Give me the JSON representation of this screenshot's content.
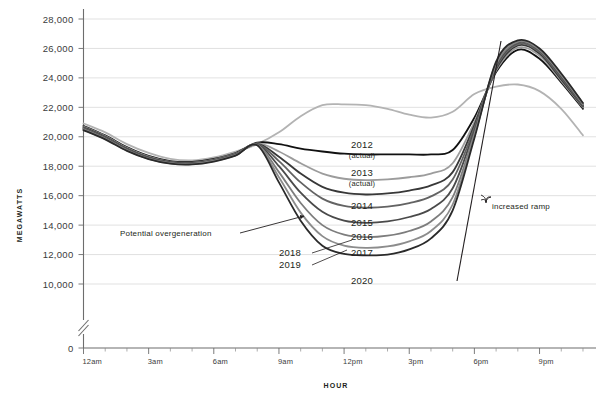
{
  "chart_data": {
    "type": "line",
    "title": "",
    "xlabel": "HOUR",
    "ylabel": "MEGAWATTS",
    "ylim": [
      0,
      28000
    ],
    "y_axis_break": true,
    "y_break_between": [
      0,
      10000
    ],
    "grid": true,
    "legend_position": "inline-labels",
    "yticks": [
      "0",
      "10,000",
      "12,000",
      "14,000",
      "16,000",
      "18,000",
      "20,000",
      "22,000",
      "24,000",
      "26,000",
      "28,000"
    ],
    "ytick_values": [
      0,
      10000,
      12000,
      14000,
      16000,
      18000,
      20000,
      22000,
      24000,
      26000,
      28000
    ],
    "xticks": [
      "12am",
      "3am",
      "6am",
      "9am",
      "12pm",
      "3pm",
      "6pm",
      "9pm"
    ],
    "xtick_values": [
      0,
      3,
      6,
      9,
      12,
      15,
      18,
      21
    ],
    "x": [
      0,
      1,
      2,
      3,
      4,
      5,
      6,
      7,
      8,
      9,
      10,
      11,
      12,
      13,
      14,
      15,
      16,
      17,
      18,
      19,
      20,
      21,
      22,
      23
    ],
    "series": [
      {
        "name": "2012",
        "sublabel": "(actual)",
        "color": "#b3b3b3",
        "width": 1.8,
        "values": [
          20900,
          20300,
          19500,
          18900,
          18500,
          18400,
          18600,
          19000,
          19500,
          20300,
          21400,
          22150,
          22200,
          22150,
          21900,
          21500,
          21300,
          21700,
          22900,
          23400,
          23550,
          23100,
          21900,
          20100
        ]
      },
      {
        "name": "2013",
        "sublabel": "(actual)",
        "color": "#111111",
        "width": 1.8,
        "values": [
          20750,
          20100,
          19300,
          18700,
          18350,
          18300,
          18500,
          18900,
          19600,
          19500,
          19200,
          19000,
          18850,
          18800,
          18800,
          18800,
          18800,
          19100,
          21300,
          24400,
          25900,
          25300,
          23700,
          21900
        ]
      },
      {
        "name": "2014",
        "sublabel": "",
        "color": "#9c9c9c",
        "width": 1.8,
        "values": [
          20700,
          20050,
          19250,
          18650,
          18300,
          18250,
          18450,
          18850,
          19550,
          19000,
          18200,
          17500,
          17150,
          17050,
          17100,
          17250,
          17500,
          18200,
          21000,
          24500,
          26050,
          25500,
          23800,
          22000
        ]
      },
      {
        "name": "2015",
        "sublabel": "",
        "color": "#383838",
        "width": 1.8,
        "values": [
          20650,
          20000,
          19200,
          18600,
          18270,
          18220,
          18420,
          18820,
          19520,
          18650,
          17500,
          16600,
          16200,
          16080,
          16150,
          16350,
          16700,
          17600,
          20800,
          24600,
          26200,
          25650,
          23900,
          22050
        ]
      },
      {
        "name": "2016",
        "sublabel": "",
        "color": "#636363",
        "width": 1.8,
        "values": [
          20600,
          19960,
          19160,
          18570,
          18250,
          18200,
          18400,
          18800,
          19500,
          18350,
          16900,
          15800,
          15300,
          15180,
          15250,
          15500,
          15950,
          17100,
          20600,
          24700,
          26300,
          25750,
          24000,
          22100
        ]
      },
      {
        "name": "2017",
        "sublabel": "",
        "color": "#4a4a4a",
        "width": 1.8,
        "values": [
          20560,
          19920,
          19130,
          18550,
          18230,
          18180,
          18380,
          18780,
          19480,
          18000,
          16200,
          14900,
          14300,
          14150,
          14250,
          14550,
          15100,
          16500,
          20400,
          24800,
          26400,
          25850,
          24100,
          22150
        ]
      },
      {
        "name": "2018",
        "sublabel": "",
        "color": "#7d7d7d",
        "width": 1.8,
        "values": [
          20520,
          19880,
          19100,
          18520,
          18210,
          18160,
          18360,
          18760,
          19460,
          17600,
          15500,
          14000,
          13350,
          13180,
          13280,
          13600,
          14250,
          15900,
          20200,
          24900,
          26450,
          25900,
          24180,
          22200
        ]
      },
      {
        "name": "2019",
        "sublabel": "",
        "color": "#8c8c8c",
        "width": 1.8,
        "values": [
          20490,
          19850,
          19070,
          18500,
          18190,
          18140,
          18340,
          18740,
          19440,
          17250,
          14850,
          13250,
          12600,
          12450,
          12550,
          12900,
          13600,
          15400,
          20050,
          25000,
          26500,
          25950,
          24240,
          22250
        ]
      },
      {
        "name": "2020",
        "sublabel": "",
        "color": "#2a2a2a",
        "width": 1.8,
        "values": [
          20450,
          19820,
          19040,
          18480,
          18170,
          18120,
          18320,
          18720,
          19420,
          16900,
          14300,
          12600,
          12050,
          11950,
          12000,
          12350,
          13100,
          15000,
          19900,
          25100,
          26550,
          26000,
          24300,
          22300
        ]
      }
    ],
    "annotations": [
      {
        "name": "potential-overgeneration",
        "text": "Potential overgeneration",
        "text_x": 120,
        "text_y": 236
      },
      {
        "name": "increased-ramp",
        "text": "increased ramp",
        "text_x": 492,
        "text_y": 209
      }
    ],
    "series_label_positions": [
      {
        "series": "2012",
        "x": 362,
        "y": 148,
        "sub_x": 359,
        "sub_y": 158
      },
      {
        "series": "2013",
        "x": 362,
        "y": 176,
        "sub_x": 359,
        "sub_y": 186
      },
      {
        "series": "2014",
        "x": 362,
        "y": 209,
        "sub_x": 0,
        "sub_y": 0
      },
      {
        "series": "2015",
        "x": 362,
        "y": 226,
        "sub_x": 0,
        "sub_y": 0
      },
      {
        "series": "2016",
        "x": 362,
        "y": 240,
        "sub_x": 0,
        "sub_y": 0
      },
      {
        "series": "2017",
        "x": 362,
        "y": 256,
        "sub_x": 0,
        "sub_y": 0
      },
      {
        "series": "2018",
        "x": 290,
        "y": 256,
        "sub_x": 0,
        "sub_y": 0
      },
      {
        "series": "2019",
        "x": 290,
        "y": 268,
        "sub_x": 0,
        "sub_y": 0
      },
      {
        "series": "2020",
        "x": 362,
        "y": 284,
        "sub_x": 0,
        "sub_y": 0
      }
    ]
  }
}
